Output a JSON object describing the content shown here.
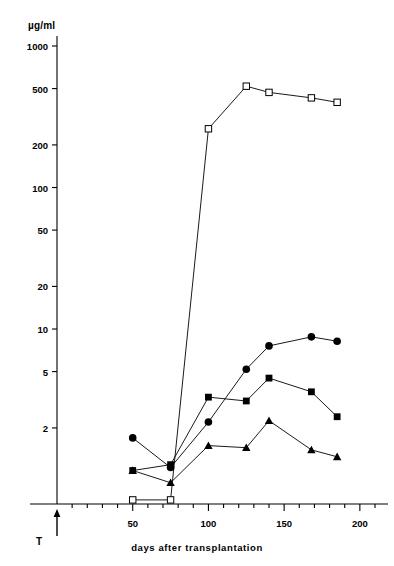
{
  "chart_data": {
    "type": "line",
    "title": "",
    "xlabel": "days  after  transplantation",
    "ylabel": "µg/ml",
    "y_scale": "log",
    "ylim": [
      0.55,
      1400
    ],
    "xlim": [
      0,
      210
    ],
    "grid": false,
    "legend": "none",
    "y_ticks": [
      1000,
      500,
      200,
      100,
      50,
      20,
      10,
      5,
      2
    ],
    "y_tick_labels": [
      "1000",
      "500",
      "200",
      "100",
      "50",
      "20",
      "10",
      "5",
      "2"
    ],
    "x_ticks": [
      50,
      100,
      150,
      200
    ],
    "x_tick_labels": [
      "50",
      "100",
      "150",
      "200"
    ],
    "x_minor_tick_step": 10,
    "annotations": [
      {
        "name": "transplant-marker",
        "label": "T",
        "x": 0,
        "type": "up-arrow"
      }
    ],
    "series": [
      {
        "name": "open-squares",
        "marker": "open-square",
        "color": "#000000",
        "points": [
          {
            "x": 50,
            "y": 0.62
          },
          {
            "x": 75,
            "y": 0.62
          },
          {
            "x": 100,
            "y": 260
          },
          {
            "x": 125,
            "y": 520
          },
          {
            "x": 140,
            "y": 470
          },
          {
            "x": 168,
            "y": 430
          },
          {
            "x": 185,
            "y": 400
          }
        ]
      },
      {
        "name": "filled-circles",
        "marker": "filled-circle",
        "color": "#000000",
        "points": [
          {
            "x": 50,
            "y": 1.7
          },
          {
            "x": 75,
            "y": 1.05
          },
          {
            "x": 100,
            "y": 2.2
          },
          {
            "x": 125,
            "y": 5.2
          },
          {
            "x": 140,
            "y": 7.6
          },
          {
            "x": 168,
            "y": 8.8
          },
          {
            "x": 185,
            "y": 8.2
          }
        ]
      },
      {
        "name": "filled-squares",
        "marker": "filled-square",
        "color": "#000000",
        "points": [
          {
            "x": 50,
            "y": 1.0
          },
          {
            "x": 75,
            "y": 1.1
          },
          {
            "x": 100,
            "y": 3.3
          },
          {
            "x": 125,
            "y": 3.1
          },
          {
            "x": 140,
            "y": 4.5
          },
          {
            "x": 168,
            "y": 3.6
          },
          {
            "x": 185,
            "y": 2.4
          }
        ]
      },
      {
        "name": "filled-triangles",
        "marker": "filled-triangle",
        "color": "#000000",
        "points": [
          {
            "x": 50,
            "y": 1.0
          },
          {
            "x": 75,
            "y": 0.82
          },
          {
            "x": 100,
            "y": 1.5
          },
          {
            "x": 125,
            "y": 1.45
          },
          {
            "x": 140,
            "y": 2.25
          },
          {
            "x": 168,
            "y": 1.4
          },
          {
            "x": 185,
            "y": 1.25
          }
        ]
      }
    ]
  }
}
